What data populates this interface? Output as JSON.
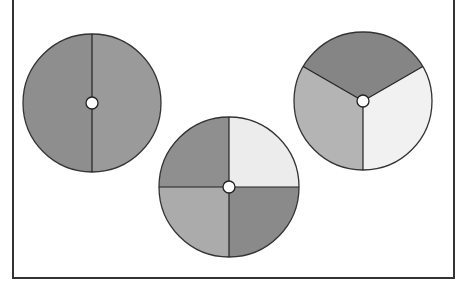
{
  "diagram": {
    "discs": [
      {
        "name": "halves",
        "sectors": 2,
        "cx": 92,
        "cy": 103,
        "r": 69,
        "fills": [
          "#8e8e8e",
          "#9a9a9a"
        ]
      },
      {
        "name": "quarters",
        "sectors": 4,
        "cx": 229,
        "cy": 187,
        "r": 70,
        "fills": [
          "#ececec",
          "#8f8f8f",
          "#ababab",
          "#8a8a8a"
        ]
      },
      {
        "name": "thirds",
        "sectors": 3,
        "cx": 363,
        "cy": 101,
        "r": 69,
        "fills": [
          "#858585",
          "#f1f1f1",
          "#b4b4b4"
        ]
      }
    ],
    "colors": {
      "stroke": "#333333",
      "background": "#ffffff",
      "hub": "#ffffff"
    }
  }
}
